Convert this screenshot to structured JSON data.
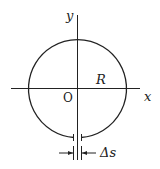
{
  "diagram": {
    "labels": {
      "y_axis": "y",
      "x_axis": "x",
      "origin": "O",
      "radius": "R",
      "gap": "Δs"
    },
    "colors": {
      "stroke": "#222222",
      "background": "#ffffff"
    }
  }
}
